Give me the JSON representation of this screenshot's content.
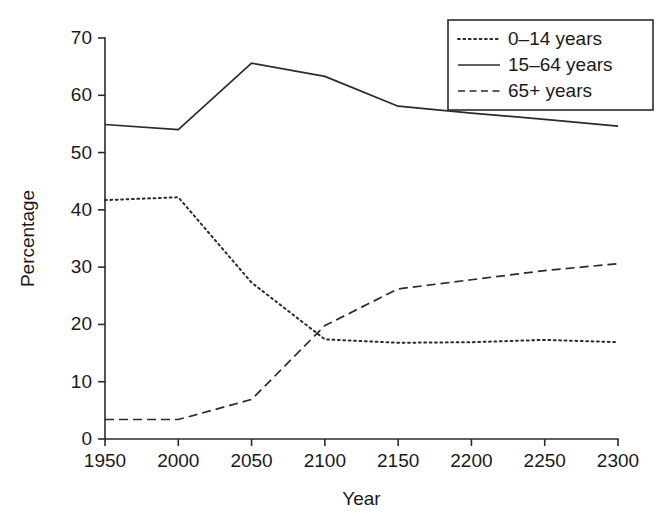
{
  "chart_data": {
    "type": "line",
    "title": "",
    "xlabel": "Year",
    "ylabel": "Percentage",
    "xlim": [
      1950,
      2300
    ],
    "ylim": [
      0,
      70
    ],
    "xticks": [
      1950,
      2000,
      2050,
      2100,
      2150,
      2200,
      2250,
      2300
    ],
    "yticks": [
      0,
      10,
      20,
      30,
      40,
      50,
      60,
      70
    ],
    "grid": false,
    "legend_position": "top-right",
    "x": [
      1950,
      2000,
      2050,
      2100,
      2150,
      2200,
      2250,
      2300
    ],
    "series": [
      {
        "name": "0–14 years",
        "style": "dotted",
        "color": "#2b2b2b",
        "values": [
          41.7,
          42.2,
          27.3,
          17.4,
          16.8,
          16.9,
          17.3,
          16.9
        ]
      },
      {
        "name": "15–64 years",
        "style": "solid",
        "color": "#2b2b2b",
        "values": [
          54.9,
          54.0,
          65.6,
          63.3,
          58.1,
          56.9,
          55.8,
          54.6
        ]
      },
      {
        "name": "65+ years",
        "style": "dashed",
        "color": "#2b2b2b",
        "values": [
          3.4,
          3.4,
          6.9,
          19.8,
          26.2,
          27.8,
          29.4,
          30.6
        ]
      }
    ]
  },
  "axes": {
    "x_title": "Year",
    "y_title": "Percentage",
    "x_tick_labels": [
      "1950",
      "2000",
      "2050",
      "2100",
      "2150",
      "2200",
      "2250",
      "2300"
    ],
    "y_tick_labels": [
      "0",
      "10",
      "20",
      "30",
      "40",
      "50",
      "60",
      "70"
    ]
  },
  "legend": {
    "items": [
      {
        "label": "0–14 years",
        "style": "dotted"
      },
      {
        "label": "15–64 years",
        "style": "solid"
      },
      {
        "label": "65+ years",
        "style": "dashed"
      }
    ]
  },
  "colors": {
    "ink": "#2b2b2b",
    "background": "#ffffff"
  }
}
